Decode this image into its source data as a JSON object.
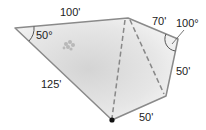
{
  "diagram": {
    "type": "pentagonal-lot-plan",
    "vertices": {
      "left": [
        15,
        28
      ],
      "top": [
        128,
        18
      ],
      "right": [
        178,
        39
      ],
      "lower_right": [
        166,
        96
      ],
      "bottom": [
        112,
        120
      ]
    },
    "side_labels": {
      "top_side": "100'",
      "upper_right_side": "70'",
      "right_side": "50'",
      "bottom_right_side": "50'",
      "left_side": "125'"
    },
    "angle_labels": {
      "left_angle": "50°",
      "right_angle": "100°"
    },
    "colors": {
      "outline": "#8a8a8a",
      "fill_light": "#f4f4f4",
      "fill_dark": "#d6d6d6",
      "dashed": "#888888",
      "point": "#111111",
      "text": "#222222"
    }
  }
}
